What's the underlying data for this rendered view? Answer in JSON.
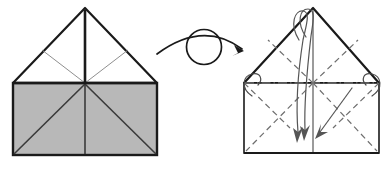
{
  "figure": {
    "background_color": "#ffffff",
    "line_color": "#1a1a1a",
    "crease_color": "#6e6e6e",
    "fill_gray": "#b8b8b8",
    "fill_white": "#ffffff",
    "arrow_color": "#555555"
  },
  "left_panel": {
    "name": "before-state",
    "shape": "house",
    "square": {
      "x": 13,
      "y": 83,
      "width": 144,
      "height": 72,
      "fill": "#b8b8b8",
      "stroke": "#1a1a1a"
    },
    "roof": {
      "apex_x": 85,
      "apex_y": 8,
      "left_x": 13,
      "left_y": 83,
      "right_x": 157,
      "right_y": 83,
      "fill": "#ffffff",
      "stroke": "#1a1a1a"
    },
    "creases": [
      {
        "name": "roof-center-vertical",
        "type": "solid",
        "weight": "heavy"
      },
      {
        "name": "roof-left-inner-diagonal",
        "type": "solid",
        "weight": "light"
      },
      {
        "name": "roof-right-inner-diagonal",
        "type": "solid",
        "weight": "light"
      },
      {
        "name": "square-center-vertical",
        "type": "solid",
        "weight": "medium"
      },
      {
        "name": "square-left-diagonal",
        "type": "solid",
        "weight": "medium"
      },
      {
        "name": "square-right-diagonal",
        "type": "solid",
        "weight": "medium"
      }
    ]
  },
  "rotate_symbol": {
    "name": "turn-over-symbol",
    "circle": {
      "cx": 204,
      "cy": 47,
      "r": 17
    },
    "arc_start_x": 156,
    "arc_start_y": 52,
    "arc_end_x": 246,
    "arc_end_y": 53,
    "label": "turn over"
  },
  "right_panel": {
    "name": "after-state",
    "shape": "house",
    "square": {
      "x": 244,
      "y": 83,
      "width": 135,
      "height": 70,
      "fill": "#ffffff",
      "stroke": "#1a1a1a"
    },
    "roof": {
      "apex_x": 313,
      "apex_y": 8,
      "left_x": 244,
      "left_y": 83,
      "right_x": 379,
      "right_y": 83,
      "fill": "#ffffff",
      "stroke": "#1a1a1a"
    },
    "creases": [
      {
        "name": "horizontal-mountain-crease",
        "type": "dash-dot"
      },
      {
        "name": "center-vertical-crease",
        "type": "solid"
      },
      {
        "name": "roof-left-valley-diagonal",
        "type": "dashed"
      },
      {
        "name": "roof-right-valley-diagonal",
        "type": "dashed"
      },
      {
        "name": "square-left-valley-diagonal",
        "type": "dashed"
      },
      {
        "name": "square-right-valley-diagonal",
        "type": "dashed"
      }
    ],
    "fold_arrows": [
      {
        "name": "left-corner-loop-arrow",
        "kind": "loop"
      },
      {
        "name": "right-corner-loop-arrow",
        "kind": "loop"
      },
      {
        "name": "apex-left-wrap-arrow",
        "kind": "wrap-down"
      },
      {
        "name": "apex-right-wrap-arrow",
        "kind": "wrap-down"
      },
      {
        "name": "right-diagonal-pull-arrow",
        "kind": "straight-down-left"
      }
    ]
  }
}
